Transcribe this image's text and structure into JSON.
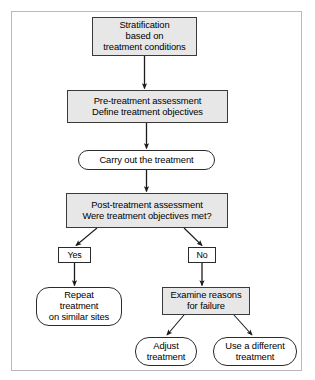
{
  "diagram": {
    "type": "flowchart",
    "title": "",
    "colors": {
      "process_fill": "#e7e7e7",
      "terminator_fill": "#ffffff",
      "stroke": "#2b2b2b",
      "frame_border": "#b9b9b9",
      "background": "#ffffff",
      "text": "#000000"
    },
    "nodes": [
      {
        "id": "stratification",
        "shape": "rectangle",
        "lines": [
          "Stratification",
          "based on",
          "treatment conditions"
        ]
      },
      {
        "id": "pretreatment",
        "shape": "rectangle",
        "lines": [
          "Pre-treatment assessment",
          "Define treatment objectives"
        ]
      },
      {
        "id": "carryout",
        "shape": "rounded",
        "lines": [
          "Carry out the treatment"
        ]
      },
      {
        "id": "posttreatment",
        "shape": "rectangle",
        "lines": [
          "Post-treatment assessment",
          "Were treatment objectives met?"
        ]
      },
      {
        "id": "yes",
        "shape": "rectangle-label",
        "lines": [
          "Yes"
        ]
      },
      {
        "id": "no",
        "shape": "rectangle-label",
        "lines": [
          "No"
        ]
      },
      {
        "id": "repeat",
        "shape": "rounded",
        "lines": [
          "Repeat",
          "treatment",
          "on similar sites"
        ]
      },
      {
        "id": "examine",
        "shape": "rectangle",
        "lines": [
          "Examine reasons",
          "for failure"
        ]
      },
      {
        "id": "adjust",
        "shape": "rounded",
        "lines": [
          "Adjust",
          "treatment"
        ]
      },
      {
        "id": "usedifferent",
        "shape": "rounded",
        "lines": [
          "Use a different",
          "treatment"
        ]
      }
    ],
    "edges": [
      {
        "from": "stratification",
        "to": "pretreatment",
        "label": ""
      },
      {
        "from": "pretreatment",
        "to": "carryout",
        "label": ""
      },
      {
        "from": "carryout",
        "to": "posttreatment",
        "label": ""
      },
      {
        "from": "posttreatment",
        "to": "yes",
        "label": "Yes"
      },
      {
        "from": "posttreatment",
        "to": "no",
        "label": "No"
      },
      {
        "from": "yes",
        "to": "repeat",
        "label": ""
      },
      {
        "from": "no",
        "to": "examine",
        "label": ""
      },
      {
        "from": "examine",
        "to": "adjust",
        "label": ""
      },
      {
        "from": "examine",
        "to": "usedifferent",
        "label": ""
      }
    ]
  }
}
